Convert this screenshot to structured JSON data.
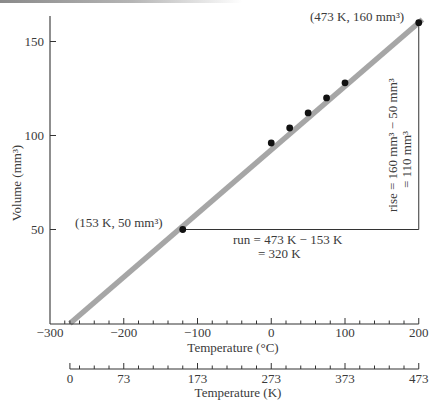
{
  "chart_data": {
    "type": "line",
    "title": "",
    "xlabel": "Temperature (°C)",
    "x2label": "Temperature (K)",
    "ylabel": "Volume (mm³)",
    "xlim": [
      -300,
      200
    ],
    "ylim": [
      0,
      160
    ],
    "grid": false,
    "legend": null,
    "x_major_ticks": [
      -300,
      -200,
      -100,
      0,
      100,
      200
    ],
    "x_tick_labels": [
      "−300",
      "−200",
      "−100",
      "0",
      "100",
      "200"
    ],
    "x_minor_tick_step": 20,
    "absolute_zero_C": -273,
    "x2_ticks_K": [
      0,
      73,
      173,
      273,
      373,
      473
    ],
    "x2_tick_labels": [
      "0",
      "73",
      "173",
      "273",
      "373",
      "473"
    ],
    "y_ticks": [
      50,
      100,
      150
    ],
    "y_tick_labels": [
      "50",
      "100",
      "150"
    ],
    "series": [
      {
        "name": "Gas volume",
        "x_K": [
          153,
          273,
          298,
          323,
          348,
          373,
          473
        ],
        "x_C": [
          -120,
          0,
          25,
          50,
          75,
          100,
          200
        ],
        "y": [
          50,
          96,
          104,
          112,
          120,
          128,
          160
        ]
      }
    ],
    "fit_line": {
      "x_K": [
        0,
        478
      ],
      "y": [
        0,
        161.7
      ],
      "color": "#a6a6a6"
    },
    "annotations": {
      "point_low": {
        "label": "(153 K, 50 mm³)",
        "x_K": 153,
        "y": 50
      },
      "point_high": {
        "label": "(473 K, 160 mm³)",
        "x_K": 473,
        "y": 160
      },
      "run_line1": "run = 473 K − 153 K",
      "run_line2": "= 320 K",
      "rise_line1": "rise = 160 mm³ − 50 mm³",
      "rise_line2": "= 110 mm³"
    }
  },
  "colors": {
    "text": "#3a3a3a",
    "axis": "#333333",
    "points": "#111111",
    "fit_line": "#a6a6a6"
  }
}
